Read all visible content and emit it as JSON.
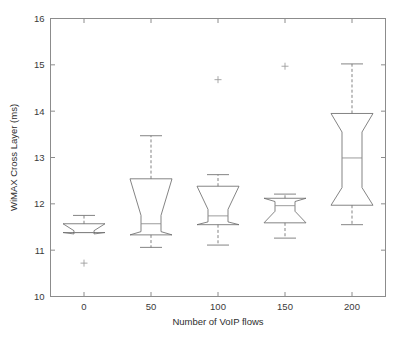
{
  "chart_data": {
    "type": "box",
    "title": "",
    "xlabel": "Number of VoIP flows",
    "ylabel": "WiMAX Cross Layer (ms)",
    "xlim": [
      -25,
      225
    ],
    "ylim": [
      10,
      16
    ],
    "xticks": [
      0,
      50,
      100,
      150,
      200
    ],
    "xticklabels": [
      "0",
      "50",
      "100",
      "150",
      "200"
    ],
    "yticks": [
      10,
      11,
      12,
      13,
      14,
      15,
      16
    ],
    "yticklabels": [
      "10",
      "11",
      "12",
      "13",
      "14",
      "15",
      "16"
    ],
    "grid": false,
    "legend": null,
    "notched": true,
    "categories": [
      "0",
      "50",
      "100",
      "150",
      "200"
    ],
    "boxes": [
      {
        "category": "0",
        "x": 0,
        "whisker_low": 11.38,
        "q1": 11.38,
        "median": 11.38,
        "q3": 11.57,
        "whisker_high": 11.75,
        "notch_low": 11.35,
        "notch_high": 11.42,
        "outliers": [
          10.72
        ]
      },
      {
        "category": "50",
        "x": 50,
        "whisker_low": 11.06,
        "q1": 11.33,
        "median": 11.57,
        "q3": 12.54,
        "whisker_high": 13.47,
        "notch_low": 11.4,
        "notch_high": 11.75,
        "outliers": []
      },
      {
        "category": "100",
        "x": 100,
        "whisker_low": 11.11,
        "q1": 11.55,
        "median": 11.74,
        "q3": 12.38,
        "whisker_high": 12.63,
        "notch_low": 11.61,
        "notch_high": 11.88,
        "outliers": [
          14.68
        ]
      },
      {
        "category": "150",
        "x": 150,
        "whisker_low": 11.26,
        "q1": 11.59,
        "median": 11.96,
        "q3": 12.12,
        "whisker_high": 12.21,
        "notch_low": 11.84,
        "notch_high": 12.05,
        "outliers": [
          14.97
        ]
      },
      {
        "category": "200",
        "x": 200,
        "whisker_low": 11.55,
        "q1": 11.97,
        "median": 12.99,
        "q3": 13.95,
        "whisker_high": 15.02,
        "notch_low": 12.35,
        "notch_high": 13.55,
        "outliers": []
      }
    ]
  },
  "axes": {
    "y_label": "WiMAX Cross Layer (ms)",
    "x_label": "Number of VoIP flows"
  }
}
